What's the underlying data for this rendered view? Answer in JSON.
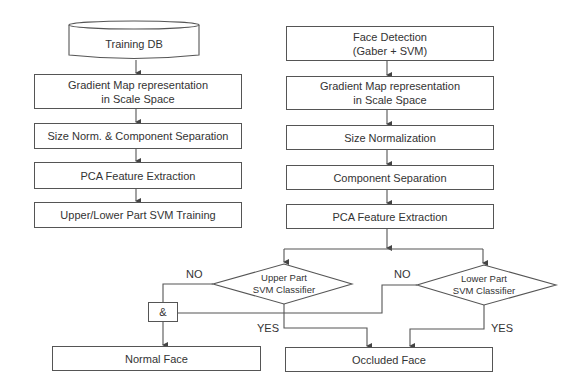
{
  "training_pipeline": {
    "database": "Training DB",
    "steps": [
      "Gradient Map representation\nin Scale Space",
      "Size Norm. & Component Separation",
      "PCA Feature Extraction",
      "Upper/Lower Part SVM Training"
    ]
  },
  "detection_pipeline": {
    "steps": [
      "Face Detection\n(Gaber + SVM)",
      "Gradient Map representation\nin Scale Space",
      "Size Normalization",
      "Component Separation",
      "PCA Feature Extraction"
    ]
  },
  "decisions": {
    "upper": "Upper Part\nSVM Classifier",
    "lower": "Lower Part\nSVM Classifier",
    "and_gate": "&",
    "no_label": "NO",
    "yes_label": "YES"
  },
  "outputs": {
    "normal": "Normal Face",
    "occluded": "Occluded Face"
  },
  "colors": {
    "line": "#555555",
    "text": "#333333",
    "background": "#ffffff"
  }
}
